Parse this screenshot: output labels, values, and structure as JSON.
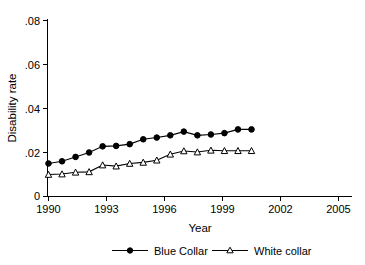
{
  "chart_data": {
    "type": "line",
    "title": "",
    "xlabel": "Year",
    "ylabel": "Disability rate",
    "xlim": [
      1989.5,
      2005.2
    ],
    "ylim": [
      0,
      0.08
    ],
    "grid": false,
    "legend_position": "bottom",
    "x_ticks": [
      "1990",
      "1993",
      "1996",
      "1999",
      "2002",
      "2005"
    ],
    "x_tick_values": [
      1990,
      1993,
      1996,
      1999,
      2002,
      2005
    ],
    "y_ticks": [
      "0",
      ".02",
      ".04",
      ".06",
      ".08"
    ],
    "y_tick_values": [
      0,
      0.02,
      0.04,
      0.06,
      0.08
    ],
    "x": [
      1990,
      1990.7,
      1991.4,
      1992.1,
      1992.8,
      1993.5,
      1994.2,
      1994.9,
      1995.6,
      1996.3,
      1997.0,
      1997.7,
      1998.4,
      1999.1,
      1999.8,
      2000.5,
      2001.2,
      2001.9,
      2002.6,
      2003.3,
      2004.0,
      2004.5
    ],
    "series": [
      {
        "name": "Blue Collar",
        "marker": "filled-circle",
        "color": "#000000",
        "x": [
          1990.0,
          1990.7,
          1991.4,
          1992.1,
          1992.8,
          1993.5,
          1994.2,
          1994.9,
          1995.6,
          1996.3,
          1997.0,
          1997.7,
          1998.4,
          1999.1,
          1999.8,
          2000.5
        ],
        "values": [
          0.015,
          0.016,
          0.018,
          0.02,
          0.0228,
          0.023,
          0.0238,
          0.026,
          0.0268,
          0.0278,
          0.0295,
          0.0278,
          0.0282,
          0.0288,
          0.0305,
          0.0305
        ]
      },
      {
        "name": "White collar",
        "marker": "open-triangle",
        "color": "#000000",
        "x": [
          1990.0,
          1990.7,
          1991.4,
          1992.1,
          1992.8,
          1993.5,
          1994.2,
          1994.9,
          1995.6,
          1996.3,
          1997.0,
          1997.7,
          1998.4,
          1999.1,
          1999.8,
          2000.5
        ],
        "values": [
          0.01,
          0.0102,
          0.011,
          0.0112,
          0.0143,
          0.0138,
          0.015,
          0.0155,
          0.0165,
          0.0192,
          0.0207,
          0.0202,
          0.021,
          0.0208,
          0.0208,
          0.0208
        ]
      }
    ],
    "legend": [
      {
        "label": "Blue Collar",
        "marker": "filled-circle"
      },
      {
        "label": "White collar",
        "marker": "open-triangle"
      }
    ]
  }
}
